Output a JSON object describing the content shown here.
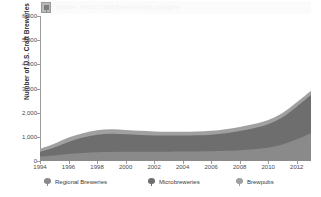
{
  "title": {
    "text": "Number of U.S. Craft Breweries by Category",
    "badge_icon": "chart-badge-icon"
  },
  "axes": {
    "ylabel": "Number of U.S. Craft Breweries",
    "yticks": [
      "0",
      "1,000",
      "2,000",
      "3,000",
      "4,000",
      "5,000",
      "6,000"
    ],
    "xticks": [
      "1994",
      "1996",
      "1998",
      "2000",
      "2002",
      "2004",
      "2006",
      "2008",
      "2010",
      "2012"
    ]
  },
  "legend": {
    "items": [
      {
        "label": "Regional Breweries",
        "color": "#8a8a8a",
        "marker": "regional-breweries-marker-icon"
      },
      {
        "label": "Microbreweries",
        "color": "#6e6e6e",
        "marker": "microbreweries-marker-icon"
      },
      {
        "label": "Brewpubs",
        "color": "#a0a0a0",
        "marker": "brewpubs-marker-icon"
      }
    ]
  },
  "chart_data": {
    "type": "area",
    "stacked": true,
    "title": "Number of U.S. Craft Breweries by Category",
    "xlabel": "",
    "ylabel": "Number of U.S. Craft Breweries",
    "xlim": [
      1994,
      2013
    ],
    "ylim": [
      0,
      6000
    ],
    "grid": false,
    "legend_position": "bottom",
    "x": [
      1994,
      1995,
      1996,
      1997,
      1998,
      1999,
      2000,
      2001,
      2002,
      2003,
      2004,
      2005,
      2006,
      2007,
      2008,
      2009,
      2010,
      2011,
      2012,
      2013
    ],
    "series": [
      {
        "name": "Regional Breweries",
        "color": "#8a8a8a",
        "values": [
          180,
          230,
          290,
          330,
          360,
          370,
          380,
          380,
          380,
          385,
          390,
          395,
          400,
          420,
          450,
          490,
          550,
          680,
          900,
          1150
        ]
      },
      {
        "name": "Microbreweries",
        "color": "#6e6e6e",
        "values": [
          200,
          330,
          500,
          640,
          730,
          760,
          730,
          700,
          680,
          670,
          665,
          670,
          690,
          730,
          790,
          870,
          970,
          1130,
          1350,
          1580
        ]
      },
      {
        "name": "Brewpubs",
        "color": "#a0a0a0",
        "values": [
          120,
          150,
          180,
          180,
          180,
          180,
          175,
          170,
          165,
          160,
          160,
          160,
          160,
          165,
          170,
          170,
          175,
          175,
          180,
          180
        ]
      }
    ],
    "totals": [
      500,
      710,
      970,
      1150,
      1270,
      1310,
      1285,
      1250,
      1225,
      1215,
      1215,
      1225,
      1250,
      1315,
      1410,
      1530,
      1695,
      1985,
      2430,
      2910
    ]
  }
}
